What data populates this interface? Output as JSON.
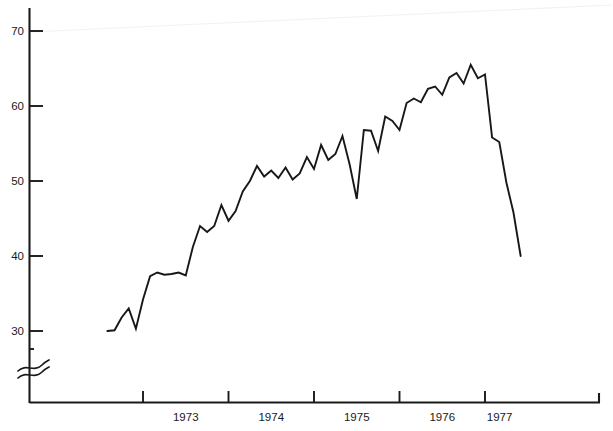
{
  "chart_data": {
    "type": "line",
    "title": "",
    "subtitle": "",
    "xlabel": "",
    "ylabel": "",
    "xlim": [
      1972.58,
      1977.5
    ],
    "ylim": [
      28.0,
      72.5
    ],
    "grid": false,
    "legend": "none",
    "y_axis_break": true,
    "y_axis_break_note": "axis broken below 30",
    "yticks": [
      30,
      40,
      50,
      60,
      70
    ],
    "ytick_labels": [
      "30",
      "40",
      "50",
      "60",
      "70"
    ],
    "xticks": [
      1973.0,
      1974.0,
      1975.0,
      1976.0,
      1977.0
    ],
    "xtick_labels": [
      "1973",
      "1974",
      "1975",
      "1976",
      "1977"
    ],
    "x_label_positions": [
      1973.5,
      1974.5,
      1975.5,
      1976.5,
      1977.17
    ],
    "series": [
      {
        "name": "series-1",
        "color": "#171717",
        "x": [
          1972.583,
          1972.667,
          1972.75,
          1972.833,
          1972.917,
          1973.0,
          1973.083,
          1973.167,
          1973.25,
          1973.333,
          1973.417,
          1973.5,
          1973.583,
          1973.667,
          1973.75,
          1973.833,
          1973.917,
          1974.0,
          1974.083,
          1974.167,
          1974.25,
          1974.333,
          1974.417,
          1974.5,
          1974.583,
          1974.667,
          1974.75,
          1974.833,
          1974.917,
          1975.0,
          1975.083,
          1975.167,
          1975.25,
          1975.333,
          1975.417,
          1975.5,
          1975.583,
          1975.667,
          1975.75,
          1975.833,
          1975.917,
          1976.0,
          1976.083,
          1976.167,
          1976.25,
          1976.333,
          1976.417,
          1976.5,
          1976.583,
          1976.667,
          1976.75,
          1976.833,
          1976.917,
          1977.0,
          1977.083,
          1977.167,
          1977.25,
          1977.333,
          1977.417
        ],
        "values": [
          30.0,
          30.1,
          31.8,
          33.0,
          30.3,
          34.2,
          37.3,
          37.8,
          37.5,
          37.6,
          37.8,
          37.4,
          41.2,
          44.0,
          43.2,
          44.0,
          46.8,
          44.7,
          46.0,
          48.6,
          50.0,
          52.0,
          50.6,
          51.4,
          50.4,
          51.8,
          50.2,
          51.0,
          53.2,
          51.6,
          54.8,
          52.8,
          53.6,
          56.0,
          52.2,
          47.6,
          56.8,
          56.7,
          54.0,
          58.6,
          58.0,
          56.8,
          60.4,
          61.0,
          60.5,
          62.3,
          62.6,
          61.5,
          63.8,
          64.4,
          63.0,
          65.5,
          63.7,
          64.2,
          55.8,
          55.2,
          49.8,
          45.8,
          40.0
        ]
      }
    ]
  },
  "axis": {
    "y_tick_labels": [
      "70",
      "60",
      "50",
      "40",
      "30"
    ],
    "x_tick_labels": [
      "1973",
      "1974",
      "1975",
      "1976",
      "1977"
    ]
  }
}
